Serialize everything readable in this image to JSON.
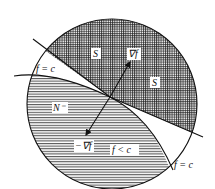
{
  "diagram": {
    "type": "geometric-illustration",
    "labels": {
      "s_top": "S",
      "s_right": "S",
      "grad": "∇f",
      "neg_grad": "−∇f",
      "n_minus": "N⁻",
      "f_less_c": "f < c",
      "f_eq_c_left": "f = c",
      "f_eq_c_bottom": "f = c"
    },
    "colors": {
      "ink": "#111111",
      "background": "#ffffff"
    }
  }
}
